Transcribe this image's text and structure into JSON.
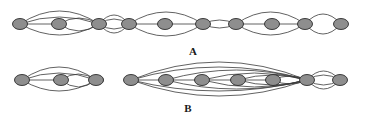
{
  "figure": {
    "background_color": "#ffffff",
    "width": 370,
    "height": 124,
    "node_fill_color": "#8e8e8e",
    "node_stroke_color": "#2b2b2b",
    "edge_color": "#3a3a3a",
    "label_color": "#1a1a1a"
  },
  "panels": [
    {
      "id": "panel-a",
      "label": "A",
      "label_x": 193,
      "label_y": 55,
      "node_count": 10,
      "nodes": [
        {
          "id": "a1",
          "cx": 20,
          "cy": 24,
          "rx": 7.5,
          "ry": 5.5
        },
        {
          "id": "a2",
          "cx": 59,
          "cy": 24,
          "rx": 7.5,
          "ry": 5.5
        },
        {
          "id": "a3",
          "cx": 99,
          "cy": 24,
          "rx": 7.5,
          "ry": 5.5
        },
        {
          "id": "a4",
          "cx": 129,
          "cy": 24,
          "rx": 7.5,
          "ry": 5.5
        },
        {
          "id": "a5",
          "cx": 165,
          "cy": 24,
          "rx": 7.5,
          "ry": 5.5
        },
        {
          "id": "a6",
          "cx": 203,
          "cy": 24,
          "rx": 7.5,
          "ry": 5.5
        },
        {
          "id": "a7",
          "cx": 236,
          "cy": 24,
          "rx": 7.5,
          "ry": 5.5
        },
        {
          "id": "a8",
          "cx": 272,
          "cy": 24,
          "rx": 7.5,
          "ry": 5.5
        },
        {
          "id": "a9",
          "cx": 305,
          "cy": 24,
          "rx": 7.5,
          "ry": 5.5
        },
        {
          "id": "a10",
          "cx": 341,
          "cy": 24,
          "rx": 7.5,
          "ry": 5.5
        }
      ],
      "edges": [
        {
          "from": "a1",
          "to": "a3",
          "bow": -13
        },
        {
          "from": "a1",
          "to": "a3",
          "bow": 11
        },
        {
          "from": "a1",
          "to": "a2",
          "bow": 0
        },
        {
          "from": "a2",
          "to": "a3",
          "bow": -6
        },
        {
          "from": "a2",
          "to": "a3",
          "bow": 7
        },
        {
          "from": "a1",
          "to": "a3",
          "bow": -7
        },
        {
          "from": "a3",
          "to": "a4",
          "bow": -5
        },
        {
          "from": "a3",
          "to": "a4",
          "bow": 5
        },
        {
          "from": "a3",
          "to": "a4",
          "bow": -9
        },
        {
          "from": "a3",
          "to": "a4",
          "bow": 9
        },
        {
          "from": "a4",
          "to": "a6",
          "bow": -12
        },
        {
          "from": "a4",
          "to": "a6",
          "bow": 12
        },
        {
          "from": "a4",
          "to": "a5",
          "bow": 0
        },
        {
          "from": "a5",
          "to": "a6",
          "bow": 0
        },
        {
          "from": "a6",
          "to": "a7",
          "bow": -4
        },
        {
          "from": "a6",
          "to": "a7",
          "bow": 4
        },
        {
          "from": "a7",
          "to": "a9",
          "bow": -12
        },
        {
          "from": "a7",
          "to": "a9",
          "bow": 11
        },
        {
          "from": "a7",
          "to": "a8",
          "bow": 0
        },
        {
          "from": "a8",
          "to": "a9",
          "bow": 0
        },
        {
          "from": "a9",
          "to": "a10",
          "bow": -10
        },
        {
          "from": "a9",
          "to": "a10",
          "bow": 10
        }
      ]
    },
    {
      "id": "panel-b",
      "label": "B",
      "label_x": 188,
      "label_y": 112,
      "node_count": 10,
      "nodes": [
        {
          "id": "b1",
          "cx": 22,
          "cy": 80,
          "rx": 7.5,
          "ry": 5.5
        },
        {
          "id": "b2",
          "cx": 61,
          "cy": 80,
          "rx": 7.5,
          "ry": 5.5
        },
        {
          "id": "b3",
          "cx": 96,
          "cy": 80,
          "rx": 7.5,
          "ry": 5.5
        },
        {
          "id": "b4",
          "cx": 131,
          "cy": 80,
          "rx": 7.5,
          "ry": 5.5
        },
        {
          "id": "b5",
          "cx": 166,
          "cy": 80,
          "rx": 7.5,
          "ry": 5.5
        },
        {
          "id": "b6",
          "cx": 202,
          "cy": 80,
          "rx": 7.5,
          "ry": 5.5
        },
        {
          "id": "b7",
          "cx": 238,
          "cy": 80,
          "rx": 7.5,
          "ry": 5.5
        },
        {
          "id": "b8",
          "cx": 273,
          "cy": 80,
          "rx": 7.5,
          "ry": 5.5
        },
        {
          "id": "b9",
          "cx": 307,
          "cy": 80,
          "rx": 7.5,
          "ry": 5.5
        },
        {
          "id": "b10",
          "cx": 340,
          "cy": 80,
          "rx": 7.5,
          "ry": 5.5
        }
      ],
      "edges": [
        {
          "from": "b1",
          "to": "b3",
          "bow": -13
        },
        {
          "from": "b1",
          "to": "b3",
          "bow": 11
        },
        {
          "from": "b1",
          "to": "b2",
          "bow": 0
        },
        {
          "from": "b2",
          "to": "b3",
          "bow": -6
        },
        {
          "from": "b2",
          "to": "b3",
          "bow": 7
        },
        {
          "from": "b1",
          "to": "b3",
          "bow": -7
        },
        {
          "from": "b3",
          "to": "b3",
          "bow": 10
        },
        {
          "from": "b4",
          "to": "b5",
          "bow": 0
        },
        {
          "from": "b4",
          "to": "b9",
          "bow": -18
        },
        {
          "from": "b4",
          "to": "b9",
          "bow": 16
        },
        {
          "from": "b4",
          "to": "b9",
          "bow": -13
        },
        {
          "from": "b4",
          "to": "b9",
          "bow": 11
        },
        {
          "from": "b5",
          "to": "b6",
          "bow": 0
        },
        {
          "from": "b5",
          "to": "b9",
          "bow": -10
        },
        {
          "from": "b5",
          "to": "b9",
          "bow": 9
        },
        {
          "from": "b6",
          "to": "b7",
          "bow": 0
        },
        {
          "from": "b6",
          "to": "b9",
          "bow": -7
        },
        {
          "from": "b6",
          "to": "b9",
          "bow": 7
        },
        {
          "from": "b7",
          "to": "b8",
          "bow": 0
        },
        {
          "from": "b7",
          "to": "b9",
          "bow": -5
        },
        {
          "from": "b7",
          "to": "b9",
          "bow": 5
        },
        {
          "from": "b8",
          "to": "b9",
          "bow": -4
        },
        {
          "from": "b8",
          "to": "b9",
          "bow": 4
        },
        {
          "from": "b9",
          "to": "b10",
          "bow": -9
        },
        {
          "from": "b9",
          "to": "b10",
          "bow": 9
        },
        {
          "from": "b9",
          "to": "b10",
          "bow": -5
        },
        {
          "from": "b9",
          "to": "b10",
          "bow": 5
        }
      ]
    }
  ]
}
